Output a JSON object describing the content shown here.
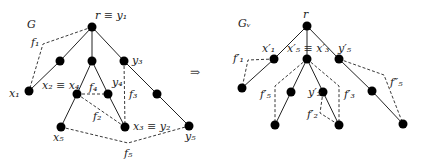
{
  "left_graph": {
    "title": "G",
    "labels": {
      "root": "r ≡ y₁",
      "f1": "f₁",
      "x1": "x₁",
      "x2x4": "x₂ ≡ x₄",
      "f4": "f₄",
      "y4": "y₄",
      "y3": "y₃",
      "f3": "f₃",
      "f2": "f₂",
      "x3y2": "x₃ ≡ y₂",
      "x5": "x₅",
      "y5": "y₅",
      "f5": "f₅"
    }
  },
  "arrow": "⇒",
  "right_graph": {
    "title": "Gᵥ",
    "labels": {
      "root": "r",
      "x1p": "x′₁",
      "f1p": "f′₁",
      "x5x3p": "x′₅ ≡ x′₃",
      "y5p": "y′₅",
      "f5p": "f′₅",
      "y2p": "y′₂",
      "f3p": "f′₃",
      "f2p": "f′₂",
      "f5pp": "f″₅"
    }
  }
}
